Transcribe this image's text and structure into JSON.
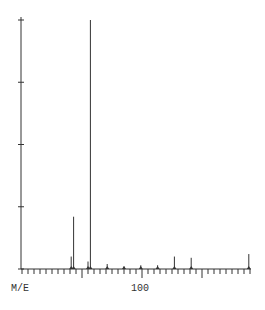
{
  "chart_data": {
    "type": "bar",
    "title": "",
    "xlabel": "M/E",
    "ylabel": "",
    "xlim": [
      0,
      190
    ],
    "ylim": [
      0,
      100
    ],
    "x_tick_labels": [
      "100"
    ],
    "x_major_ticks": [
      50,
      100,
      150
    ],
    "x_minor_tick_step": 5,
    "y_ticks": [
      0,
      25,
      50,
      75,
      100
    ],
    "grid": false,
    "legend": null,
    "series": [
      {
        "name": "relative abundance",
        "x": [
          41,
          43,
          55,
          57,
          71,
          85,
          99,
          113,
          127,
          141,
          189
        ],
        "values": [
          5,
          21,
          3,
          100,
          2,
          1,
          1.5,
          1.5,
          5,
          4.5,
          6
        ]
      }
    ]
  },
  "labels": {
    "x_axis_title": "M/E",
    "x_tick_100": "100"
  },
  "style": {
    "line_color": "#333333",
    "background": "#ffffff"
  }
}
